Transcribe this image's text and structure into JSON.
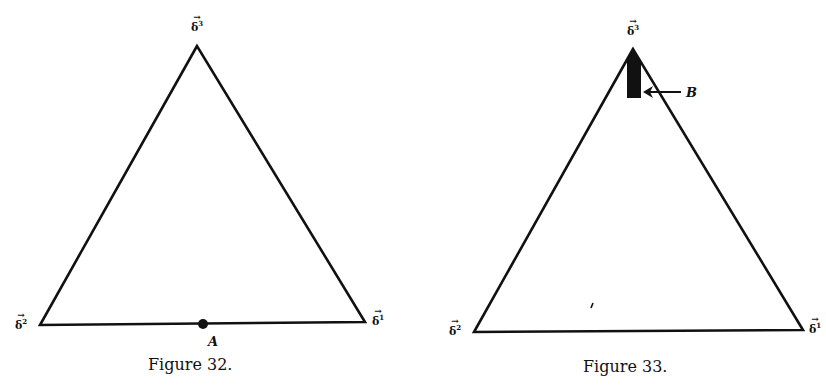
{
  "figures": [
    {
      "caption": "Figure 32.",
      "vertices": {
        "top": {
          "symbol": "δ",
          "sup": "3",
          "arrow": "→"
        },
        "left": {
          "symbol": "δ",
          "sup": "2",
          "arrow": "→"
        },
        "right": {
          "symbol": "δ",
          "sup": "1",
          "arrow": "→"
        }
      },
      "point_label": "A"
    },
    {
      "caption": "Figure 33.",
      "vertices": {
        "top": {
          "symbol": "δ",
          "sup": "3",
          "arrow": "→"
        },
        "left": {
          "symbol": "δ",
          "sup": "2",
          "arrow": "→"
        },
        "right": {
          "symbol": "δ",
          "sup": "1",
          "arrow": "→"
        }
      },
      "region_label": "B"
    }
  ],
  "colors": {
    "ink": "#111111",
    "paper": "#ffffff"
  }
}
